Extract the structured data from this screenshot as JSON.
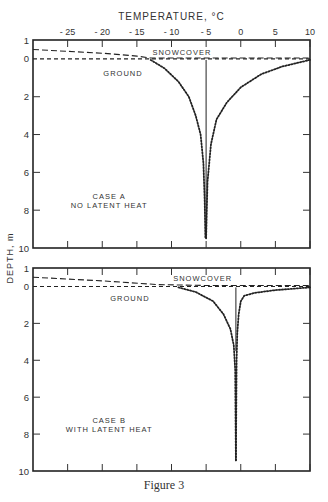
{
  "figure": {
    "caption": "Figure 3",
    "xlabel": "TEMPERATURE, °C",
    "ylabel": "DEPTH, m"
  },
  "chart_data": [
    {
      "type": "line",
      "title": "CASE A NO LATENT HEAT",
      "annotation_lines": [
        "CASE A",
        "NO LATENT HEAT"
      ],
      "xlabel": "TEMPERATURE, °C",
      "ylabel": "DEPTH, m",
      "xlim": [
        -30,
        10
      ],
      "ylim": [
        1,
        10
      ],
      "x_ticks": [
        -25,
        -20,
        -15,
        -10,
        -5,
        0,
        5,
        10
      ],
      "y_ticks": [
        1,
        0,
        2,
        4,
        6,
        8,
        10
      ],
      "labels": {
        "snowcover": "SNOWCOVER",
        "ground": "GROUND"
      },
      "series": [
        {
          "name": "Snowcover surface",
          "style": "dashed",
          "x": [
            -30,
            -20,
            -15,
            -13,
            -5,
            10
          ],
          "y": [
            0.5,
            0.3,
            0.15,
            0.05,
            0.05,
            0.05
          ]
        },
        {
          "name": "Ground surface",
          "style": "dashed",
          "x": [
            -30,
            10
          ],
          "y": [
            0.0,
            0.0
          ]
        },
        {
          "name": "Cold profile",
          "style": "dotted",
          "x": [
            -13,
            -11,
            -9,
            -7.5,
            -6.5,
            -5.8,
            -5.4,
            -5.2,
            -5.1
          ],
          "y": [
            0.05,
            0.5,
            1.2,
            2.0,
            3.0,
            4.0,
            5.5,
            7.5,
            9.5
          ]
        },
        {
          "name": "Warm profile",
          "style": "dotted",
          "x": [
            10,
            6,
            3,
            0,
            -2,
            -3.5,
            -4.3,
            -4.8,
            -5.0
          ],
          "y": [
            0.05,
            0.4,
            0.8,
            1.5,
            2.3,
            3.2,
            4.5,
            6.5,
            9.5
          ]
        },
        {
          "name": "Reference",
          "style": "solid",
          "x": [
            -5,
            -5
          ],
          "y": [
            0.05,
            9.5
          ]
        }
      ]
    },
    {
      "type": "line",
      "title": "CASE B WITH LATENT HEAT",
      "annotation_lines": [
        "CASE B",
        "WITH LATENT HEAT"
      ],
      "xlabel": "TEMPERATURE, °C",
      "ylabel": "DEPTH, m",
      "xlim": [
        -30,
        10
      ],
      "ylim": [
        1,
        10
      ],
      "x_ticks": [
        -25,
        -20,
        -15,
        -10,
        -5,
        0,
        5,
        10
      ],
      "y_ticks": [
        1,
        0,
        2,
        4,
        6,
        8,
        10
      ],
      "labels": {
        "snowcover": "SNOWCOVER",
        "ground": "GROUND"
      },
      "series": [
        {
          "name": "Snowcover surface",
          "style": "dashed",
          "x": [
            -30,
            -20,
            -12,
            -5,
            10
          ],
          "y": [
            0.5,
            0.3,
            0.1,
            0.05,
            0.05
          ]
        },
        {
          "name": "Ground surface",
          "style": "dashed",
          "x": [
            -30,
            10
          ],
          "y": [
            0.0,
            0.0
          ]
        },
        {
          "name": "Cold profile",
          "style": "dotted",
          "x": [
            -9,
            -6.5,
            -4,
            -2.5,
            -1.5,
            -1.0,
            -0.8,
            -0.7
          ],
          "y": [
            0.05,
            0.3,
            0.8,
            1.5,
            2.3,
            3.2,
            4.5,
            9.5
          ]
        },
        {
          "name": "Warm profile",
          "style": "dotted",
          "x": [
            10,
            5,
            2,
            0.5,
            0,
            -0.3,
            -0.5,
            -0.6,
            -0.7
          ],
          "y": [
            0.05,
            0.2,
            0.35,
            0.5,
            0.8,
            1.5,
            2.5,
            4.0,
            9.5
          ]
        },
        {
          "name": "Reference",
          "style": "solid",
          "x": [
            -0.7,
            -0.7
          ],
          "y": [
            0.05,
            3.5
          ]
        }
      ]
    }
  ]
}
